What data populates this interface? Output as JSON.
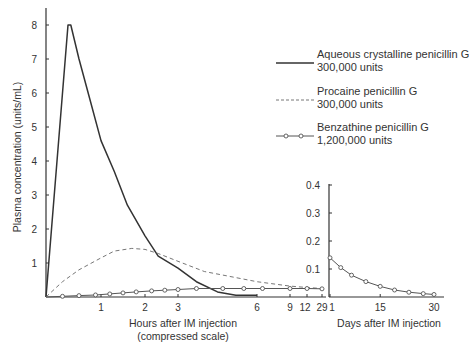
{
  "chart_data": {
    "type": "line",
    "title": "",
    "ylabel": "Plasma concentration (units/mL)",
    "legend_position": "upper right",
    "grid": false,
    "panels": [
      {
        "id": "hours",
        "xlabel": "Hours after IM injection",
        "xlabel_sub": "(compressed scale)",
        "xtick_labels": [
          "1",
          "2",
          "3",
          "6",
          "9",
          "12",
          "29"
        ],
        "ylim": [
          0,
          8.5
        ],
        "ytick_labels": [
          "1",
          "2",
          "3",
          "4",
          "5",
          "6",
          "7",
          "8"
        ],
        "series": [
          {
            "name": "Aqueous crystalline penicillin G 300,000 units",
            "style": "solid",
            "points": [
              [
                0,
                0
              ],
              [
                0.4,
                8.0
              ],
              [
                0.45,
                8.0
              ],
              [
                0.6,
                7.0
              ],
              [
                0.8,
                5.8
              ],
              [
                1.0,
                4.6
              ],
              [
                1.3,
                3.7
              ],
              [
                1.6,
                2.7
              ],
              [
                2.0,
                1.8
              ],
              [
                2.4,
                1.2
              ],
              [
                3.0,
                0.85
              ],
              [
                3.7,
                0.45
              ],
              [
                4.5,
                0.15
              ],
              [
                5.2,
                0.05
              ],
              [
                6.0,
                0.05
              ]
            ]
          },
          {
            "name": "Procaine penicillin G 300,000 units",
            "style": "dashed",
            "points": [
              [
                0,
                0
              ],
              [
                0.3,
                0.45
              ],
              [
                0.6,
                0.8
              ],
              [
                1.0,
                1.15
              ],
              [
                1.3,
                1.35
              ],
              [
                1.7,
                1.43
              ],
              [
                2.0,
                1.4
              ],
              [
                2.4,
                1.28
              ],
              [
                3.0,
                1.05
              ],
              [
                4.0,
                0.75
              ],
              [
                6.0,
                0.45
              ],
              [
                9.0,
                0.32
              ],
              [
                12.0,
                0.28
              ],
              [
                29.0,
                0.25
              ]
            ]
          },
          {
            "name": "Benzathine penicillin G 1,200,000 units",
            "style": "line-with-circles",
            "points": [
              [
                0,
                0
              ],
              [
                0.3,
                0.02
              ],
              [
                0.6,
                0.04
              ],
              [
                0.9,
                0.06
              ],
              [
                1.2,
                0.09
              ],
              [
                1.5,
                0.12
              ],
              [
                1.8,
                0.15
              ],
              [
                2.2,
                0.18
              ],
              [
                2.6,
                0.2
              ],
              [
                3.0,
                0.22
              ],
              [
                3.7,
                0.25
              ],
              [
                4.7,
                0.25
              ],
              [
                5.5,
                0.25
              ],
              [
                6.5,
                0.25
              ],
              [
                9.0,
                0.25
              ],
              [
                12.0,
                0.25
              ],
              [
                29.0,
                0.24
              ]
            ]
          }
        ]
      },
      {
        "id": "days",
        "xlabel": "Days after IM injection",
        "xtick_labels": [
          "1",
          "15",
          "30"
        ],
        "ylim": [
          0,
          0.4
        ],
        "ytick_labels": [
          "0.1",
          "0.2",
          "0.3",
          "0.4"
        ],
        "series": [
          {
            "name": "Benzathine penicillin G 1,200,000 units",
            "style": "line-with-circles",
            "points": [
              [
                1,
                0.14
              ],
              [
                4,
                0.105
              ],
              [
                7,
                0.078
              ],
              [
                11,
                0.055
              ],
              [
                15,
                0.038
              ],
              [
                19,
                0.025
              ],
              [
                23,
                0.017
              ],
              [
                27,
                0.012
              ],
              [
                30,
                0.009
              ]
            ]
          }
        ]
      }
    ],
    "legend": [
      {
        "line1": "Aqueous crystalline penicillin G",
        "line2": "300,000 units",
        "style": "solid"
      },
      {
        "line1": "Procaine penicillin G",
        "line2": "300,000 units",
        "style": "dashed"
      },
      {
        "line1": "Benzathine penicillin G",
        "line2": "1,200,000 units",
        "style": "line-with-circles"
      }
    ]
  }
}
